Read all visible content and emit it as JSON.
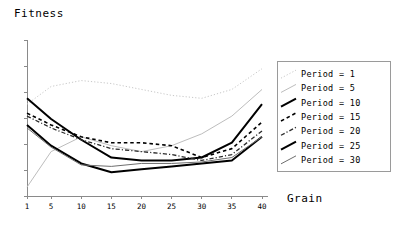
{
  "chart_data": {
    "type": "line",
    "title": "",
    "ylabel": "Fitness",
    "xlabel": "Grain",
    "grid": false,
    "legend_position": "right",
    "xlim": [
      1,
      40
    ],
    "ylim": [
      0,
      100
    ],
    "xticks": [
      1,
      5,
      10,
      15,
      20,
      25,
      30,
      35,
      40
    ],
    "xtick_labels": [
      "1",
      "5",
      "10",
      "15",
      "20",
      "25",
      "30",
      "35",
      "40"
    ],
    "ytick_labels": [],
    "x": [
      1,
      5,
      10,
      15,
      20,
      25,
      30,
      35,
      40
    ],
    "series": [
      {
        "name": "Period = 1",
        "legend_label": "Period = 1",
        "color": "#c8c8c8",
        "style": "dotted",
        "width": 1,
        "values": [
          62,
          74,
          78,
          76,
          72,
          68,
          66,
          72,
          86
        ]
      },
      {
        "name": "Period = 5",
        "legend_label": "Period = 5",
        "color": "#bdbdbd",
        "style": "solid",
        "width": 1,
        "values": [
          6,
          30,
          40,
          34,
          30,
          34,
          42,
          54,
          72
        ]
      },
      {
        "name": "Period = 10",
        "legend_label": "Period = 10",
        "color": "#000000",
        "style": "solid",
        "width": 2,
        "values": [
          66,
          52,
          38,
          26,
          24,
          24,
          26,
          36,
          62
        ]
      },
      {
        "name": "Period = 15",
        "legend_label": "Period = 15",
        "color": "#000000",
        "style": "dashed",
        "width": 1.6,
        "values": [
          56,
          48,
          40,
          36,
          36,
          34,
          26,
          32,
          50
        ]
      },
      {
        "name": "Period = 20",
        "legend_label": "Period = 20",
        "color": "#2b2b2b",
        "style": "dashdot",
        "width": 1.3,
        "values": [
          54,
          46,
          38,
          32,
          30,
          28,
          24,
          28,
          44
        ]
      },
      {
        "name": "Period = 25",
        "legend_label": "Period = 25",
        "color": "#000000",
        "style": "solid",
        "width": 2,
        "values": [
          48,
          34,
          22,
          16,
          18,
          20,
          22,
          24,
          40
        ]
      },
      {
        "name": "Period = 30",
        "legend_label": "Period = 30",
        "color": "#6e6e6e",
        "style": "solid",
        "width": 1,
        "values": [
          46,
          33,
          21,
          20,
          22,
          22,
          23,
          26,
          40
        ]
      }
    ]
  },
  "axes": {
    "ylabel_text": "Fitness",
    "xlabel_text": "Grain"
  }
}
